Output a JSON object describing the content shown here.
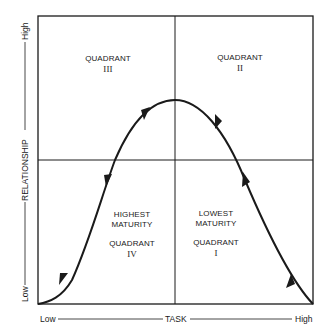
{
  "diagram": {
    "x_axis": {
      "title": "TASK",
      "low": "Low",
      "high": "High"
    },
    "y_axis": {
      "title": "RELATIONSHIP",
      "low": "Low",
      "high": "High"
    },
    "quadrants": [
      {
        "id": "III",
        "title": "QUADRANT",
        "numeral": "III",
        "position": "top-left"
      },
      {
        "id": "II",
        "title": "QUADRANT",
        "numeral": "II",
        "position": "top-right"
      },
      {
        "id": "IV",
        "title": "QUADRANT",
        "numeral": "IV",
        "position": "bottom-left",
        "note_line1": "HIGHEST",
        "note_line2": "MATURITY"
      },
      {
        "id": "I",
        "title": "QUADRANT",
        "numeral": "I",
        "position": "bottom-right",
        "note_line1": "LOWEST",
        "note_line2": "MATURITY"
      }
    ],
    "curve": {
      "shape": "bell",
      "direction": "from bottom-right (Quadrant I) up through II, over peak, down through III to bottom-left (Quadrant IV)"
    },
    "colors": {
      "line": "#1a1a1a",
      "background": "#ffffff"
    }
  }
}
